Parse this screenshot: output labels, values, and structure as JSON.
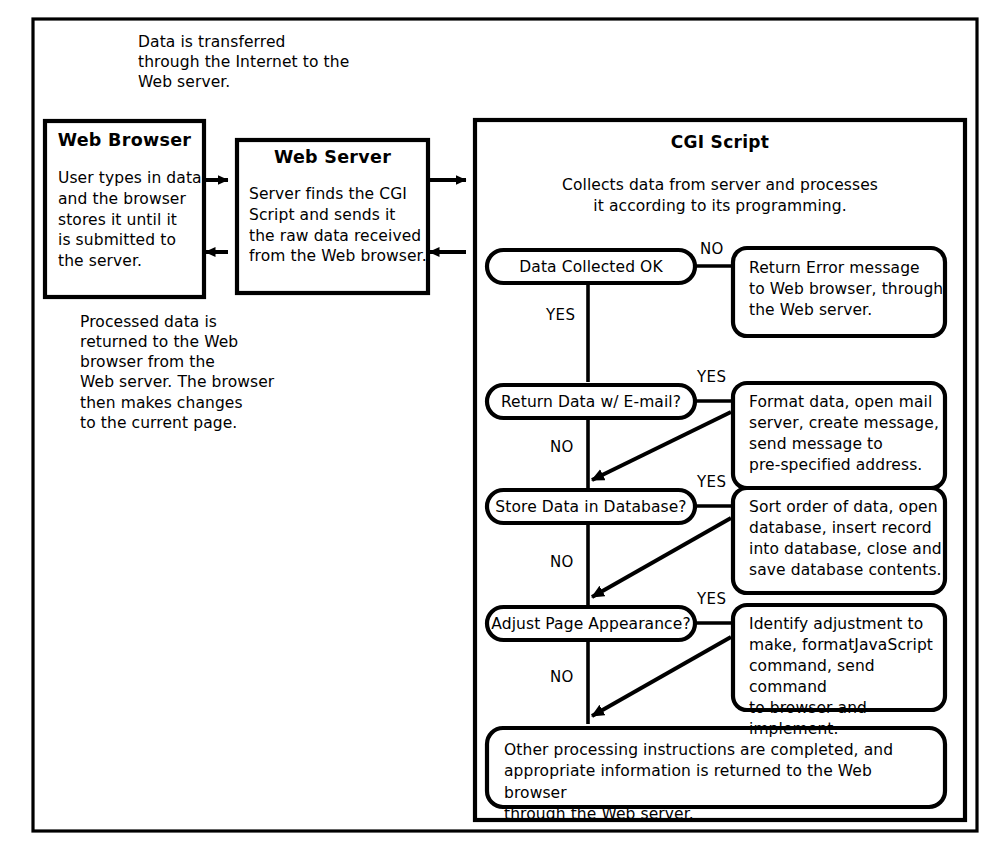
{
  "diagram": {
    "colors": {
      "stroke": "#000000",
      "fill": "#ffffff",
      "text": "#000000"
    }
  },
  "notes": {
    "top_note": "Data is transferred\nthrough the Internet to the\nWeb server.",
    "bottom_note": "Processed data is\nreturned to the Web\nbrowser from the\nWeb server. The browser\nthen makes changes\nto the current page."
  },
  "boxes": {
    "web_browser": {
      "title": "Web Browser",
      "body": "User types in data\nand the browser\nstores it until it\nis submitted to\nthe server."
    },
    "web_server": {
      "title": "Web Server",
      "body": "Server finds the CGI\nScript and sends it\nthe raw data received\nfrom the Web browser."
    },
    "cgi_script": {
      "title": "CGI Script",
      "subtitle": "Collects data from server and processes\nit according to its programming."
    }
  },
  "flow": {
    "steps": [
      {
        "id": "data-collected",
        "decision": "Data Collected OK",
        "branch_side_label": "NO",
        "branch_down_label": "YES",
        "action": "Return Error message\nto Web browser, through\nthe Web server.",
        "has_return_arrow": false
      },
      {
        "id": "return-email",
        "decision": "Return Data w/ E-mail?",
        "branch_side_label": "YES",
        "branch_down_label": "NO",
        "action": "Format data, open mail\nserver, create message,\nsend message to\npre-specified address.",
        "has_return_arrow": true
      },
      {
        "id": "store-database",
        "decision": "Store Data in Database?",
        "branch_side_label": "YES",
        "branch_down_label": "NO",
        "action": "Sort order of data, open\ndatabase, insert record\ninto database, close and\nsave database contents.",
        "has_return_arrow": true
      },
      {
        "id": "adjust-page",
        "decision": "Adjust Page Appearance?",
        "branch_side_label": "YES",
        "branch_down_label": "NO",
        "action": "Identify adjustment to\nmake, formatJavaScript\ncommand, send command\nto browser and implement.",
        "has_return_arrow": true
      }
    ],
    "final": "Other processing instructions are completed, and\nappropriate information is returned to the Web browser\nthrough the Web server."
  },
  "connectors": {
    "browser_to_server": "arrow-right",
    "server_to_browser": "arrow-left",
    "server_to_cgi": "arrow-right",
    "cgi_to_server": "arrow-left"
  }
}
